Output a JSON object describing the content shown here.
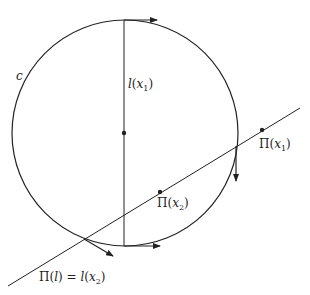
{
  "diagram": {
    "colors": {
      "stroke": "#222222",
      "background": "#ffffff"
    },
    "circle": {
      "label": "c",
      "cx": 125,
      "cy": 133,
      "r": 113
    },
    "vertical_line": {
      "label_fn": "l",
      "label_arg": "x",
      "label_sub": "1"
    },
    "points": {
      "center": {
        "x": 124,
        "y": 133
      },
      "pi_x1": {
        "x": 262,
        "y": 130,
        "label_fn": "Π",
        "label_arg": "x",
        "label_sub": "1"
      },
      "pi_x2": {
        "x": 160,
        "y": 192,
        "label_fn": "Π",
        "label_arg": "x",
        "label_sub": "2"
      }
    },
    "bottom_label": {
      "left_fn": "Π",
      "left_arg": "l",
      "equals": "=",
      "right_fn": "l",
      "right_arg": "x",
      "right_sub": "2"
    },
    "arrows": [
      "top-tangent-right",
      "right-intersection-down",
      "bottom-tangent-right",
      "lower-left-tangent"
    ]
  }
}
